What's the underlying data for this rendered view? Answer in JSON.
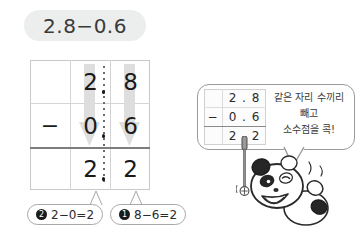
{
  "title": {
    "expression": "2.8−0.6"
  },
  "calc_table": {
    "rows": [
      {
        "op": "",
        "ones": "2",
        "tenths": "8"
      },
      {
        "op": "−",
        "ones": "0",
        "tenths": "6"
      },
      {
        "op": "",
        "ones": "2",
        "tenths": "2"
      }
    ],
    "decimal_point": ".",
    "arrow_icon": "down-arrow-icon"
  },
  "callouts": [
    {
      "badge": "2",
      "text": "2−0=2"
    },
    {
      "badge": "1",
      "text": "8−6=2"
    }
  ],
  "speech_bubble": {
    "mini_table": {
      "rows": [
        {
          "op": "",
          "value": "2 . 8"
        },
        {
          "op": "−",
          "value": "0 . 6"
        },
        {
          "op": "",
          "value": "2 . 2"
        }
      ]
    },
    "instruction_lines": [
      "같은 자리 수끼리",
      "빼고",
      "소수점을 콕!"
    ]
  },
  "character": {
    "name": "panda-character",
    "prop": "pointer-stick"
  },
  "colors": {
    "pill_background": "#eceded",
    "table_border": "#c9c9c9",
    "arrow_fill": "#dcdcdc",
    "text": "#231f20",
    "badge_background": "#1a1a1a",
    "bubble_border": "#9a9a9a"
  }
}
